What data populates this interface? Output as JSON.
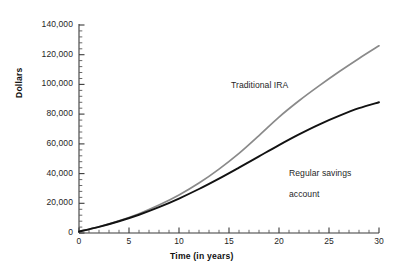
{
  "chart_data": {
    "type": "line",
    "title": "",
    "xlabel": "Time (in years)",
    "ylabel": "Dollars",
    "xlim": [
      0,
      30
    ],
    "ylim": [
      0,
      140000
    ],
    "xticks": [
      0,
      5,
      10,
      15,
      20,
      25,
      30
    ],
    "xtick_labels": [
      "0",
      "5",
      "10",
      "15",
      "20",
      "25",
      "30"
    ],
    "x_minor_tick_step": 1,
    "yticks": [
      0,
      20000,
      40000,
      60000,
      80000,
      100000,
      120000,
      140000
    ],
    "ytick_labels": [
      "0",
      "20,000",
      "40,000",
      "60,000",
      "80,000",
      "100,000",
      "120,000",
      "140,000"
    ],
    "y_minor_tick_step": 4000,
    "grid": false,
    "legend_position": "inline-annotations",
    "x": [
      0,
      2,
      4,
      6,
      8,
      10,
      12,
      14,
      16,
      18,
      20,
      22,
      24,
      26,
      28,
      30
    ],
    "series": [
      {
        "name": "Traditional IRA",
        "color": "#8a8a8a",
        "values": [
          1000,
          4200,
          8200,
          13000,
          18800,
          25600,
          33600,
          43000,
          53600,
          65600,
          78000,
          89000,
          99000,
          108500,
          117500,
          126000
        ]
      },
      {
        "name": "Regular savings account",
        "color": "#121212",
        "values": [
          1000,
          4100,
          7900,
          12300,
          17400,
          23200,
          29600,
          36600,
          44000,
          51600,
          59200,
          66400,
          73000,
          78800,
          84000,
          88000
        ]
      }
    ],
    "annotations": [
      {
        "text": "Traditional IRA",
        "series": "Traditional IRA"
      },
      {
        "text": "Regular savings\naccount",
        "series": "Regular savings account"
      }
    ]
  },
  "axes": {
    "y_title": "Dollars",
    "x_title": "Time (in years)",
    "y_labels": [
      "140,000",
      "120,000",
      "100,000",
      "80,000",
      "60,000",
      "40,000",
      "20,000",
      "0"
    ],
    "x_labels": [
      "0",
      "5",
      "10",
      "15",
      "20",
      "25",
      "30"
    ]
  },
  "labels": {
    "traditional_ira": "Traditional IRA",
    "regular_savings_line1": "Regular savings",
    "regular_savings_line2": "account"
  },
  "colors": {
    "ira_line": "#8a8a8a",
    "savings_line": "#121212",
    "axis": "#3a3a3a",
    "background": "#ffffff"
  }
}
